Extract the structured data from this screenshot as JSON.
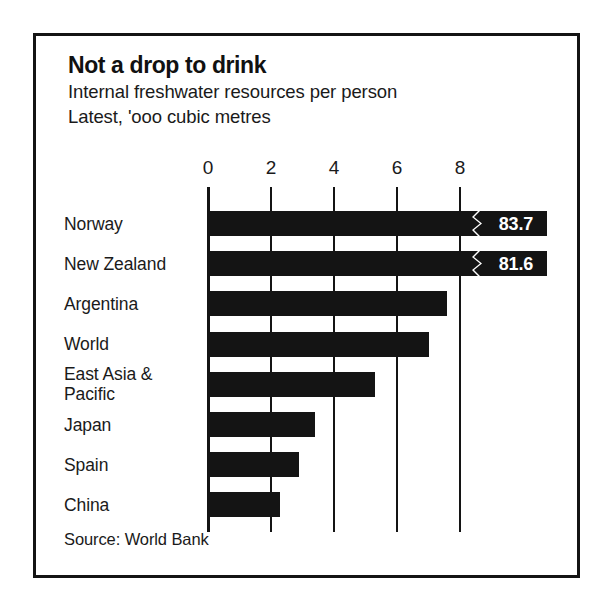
{
  "chart_data": {
    "type": "bar",
    "orientation": "horizontal",
    "title": "Not a drop to drink",
    "subtitle_lines": [
      "Internal freshwater resources per person",
      "Latest, 'ooo cubic metres"
    ],
    "source": "Source: World Bank",
    "xlabel": "",
    "ylabel": "",
    "xlim": [
      0,
      8.6
    ],
    "axis_ticks": [
      0,
      2,
      4,
      6,
      8
    ],
    "tick_labels": [
      "0",
      "2",
      "4",
      "6",
      "8"
    ],
    "grid": true,
    "legend": false,
    "categories": [
      "Norway",
      "New Zealand",
      "Argentina",
      "World",
      "East Asia &\nPacific",
      "Japan",
      "Spain",
      "China"
    ],
    "values": [
      83.7,
      81.6,
      7.6,
      7.0,
      5.3,
      3.4,
      2.9,
      2.3
    ],
    "bars": [
      {
        "label": "Norway",
        "label_lines": [
          "Norway"
        ],
        "value": 83.7,
        "display_value": "83.7",
        "plotted_extent": 8.6,
        "broken": true
      },
      {
        "label": "New Zealand",
        "label_lines": [
          "New Zealand"
        ],
        "value": 81.6,
        "display_value": "81.6",
        "plotted_extent": 8.6,
        "broken": true
      },
      {
        "label": "Argentina",
        "label_lines": [
          "Argentina"
        ],
        "value": 7.6,
        "display_value": "",
        "plotted_extent": 7.6,
        "broken": false
      },
      {
        "label": "World",
        "label_lines": [
          "World"
        ],
        "value": 7.0,
        "display_value": "",
        "plotted_extent": 7.0,
        "broken": false
      },
      {
        "label": "East Asia & Pacific",
        "label_lines": [
          "East Asia &",
          "Pacific"
        ],
        "value": 5.3,
        "display_value": "",
        "plotted_extent": 5.3,
        "broken": false
      },
      {
        "label": "Japan",
        "label_lines": [
          "Japan"
        ],
        "value": 3.4,
        "display_value": "",
        "plotted_extent": 3.4,
        "broken": false
      },
      {
        "label": "Spain",
        "label_lines": [
          "Spain"
        ],
        "value": 2.9,
        "display_value": "",
        "plotted_extent": 2.9,
        "broken": false
      },
      {
        "label": "China",
        "label_lines": [
          "China"
        ],
        "value": 2.3,
        "display_value": "",
        "plotted_extent": 2.3,
        "broken": false
      }
    ],
    "colors": {
      "bar": "#141414",
      "axis": "#141414",
      "text": "#1a1a1a",
      "value_text": "#ffffff",
      "background": "#ffffff",
      "frame": "#141414"
    }
  }
}
